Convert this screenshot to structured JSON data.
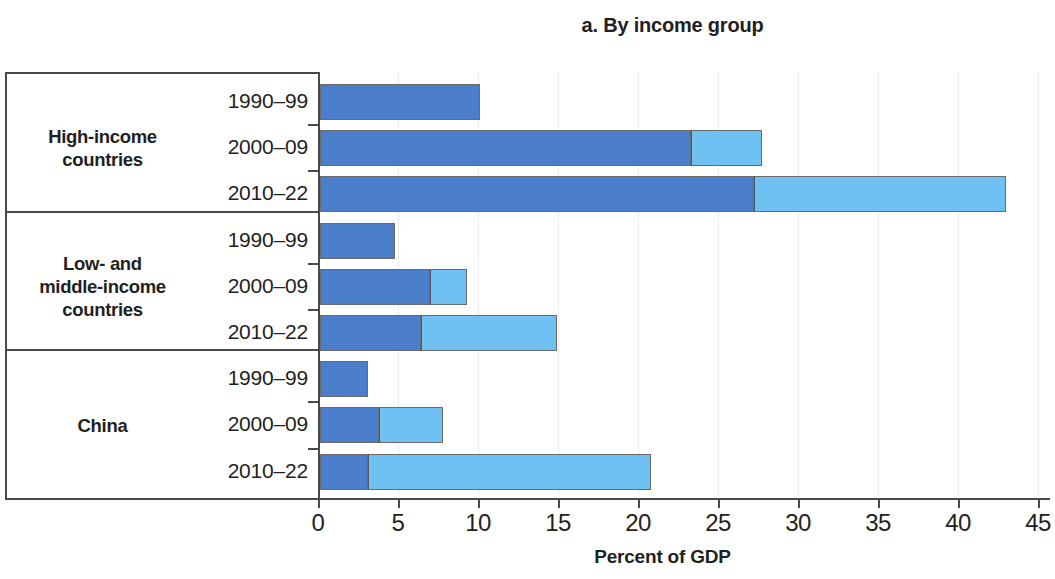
{
  "chart_data": {
    "type": "bar",
    "title": "a. By income group",
    "xlabel": "Percent of GDP",
    "ylabel": "",
    "xlim": [
      0,
      45
    ],
    "xticks": [
      0,
      5,
      10,
      15,
      20,
      25,
      30,
      35,
      40,
      45
    ],
    "xtick_labels": [
      "0",
      "5",
      "10",
      "15",
      "20",
      "25",
      "30",
      "35",
      "40",
      "45"
    ],
    "grid": true,
    "orientation": "horizontal",
    "stacked": true,
    "legend": null,
    "colors": {
      "series_1": "#4a7ecb",
      "series_2": "#6ec1f2",
      "axis": "#4a4a4a",
      "text": "#231f20",
      "gridline": "#ececec",
      "background": "#ffffff"
    },
    "groups": [
      {
        "label": "High-income\ncountries",
        "label_line_1": "High-income",
        "label_line_2": "countries",
        "rows": [
          {
            "category": "1990–99",
            "segments": [
              10.0,
              0.0
            ],
            "total": 10.0
          },
          {
            "category": "2000–09",
            "segments": [
              23.2,
              4.4
            ],
            "total": 27.6
          },
          {
            "category": "2010–22",
            "segments": [
              27.1,
              15.8
            ],
            "total": 42.9
          }
        ]
      },
      {
        "label": "Low- and\nmiddle-income\ncountries",
        "label_line_1": "Low- and",
        "label_line_2": "middle-income",
        "label_line_3": "countries",
        "rows": [
          {
            "category": "1990–99",
            "segments": [
              4.7,
              0.0
            ],
            "total": 4.7
          },
          {
            "category": "2000–09",
            "segments": [
              6.9,
              2.3
            ],
            "total": 9.2
          },
          {
            "category": "2010–22",
            "segments": [
              6.3,
              8.5
            ],
            "total": 14.8
          }
        ]
      },
      {
        "label": "China",
        "label_line_1": "China",
        "rows": [
          {
            "category": "1990–99",
            "segments": [
              3.0,
              0.0
            ],
            "total": 3.0
          },
          {
            "category": "2000–09",
            "segments": [
              3.7,
              4.0
            ],
            "total": 7.7
          },
          {
            "category": "2010–22",
            "segments": [
              3.0,
              17.7
            ],
            "total": 20.7
          }
        ]
      }
    ]
  }
}
